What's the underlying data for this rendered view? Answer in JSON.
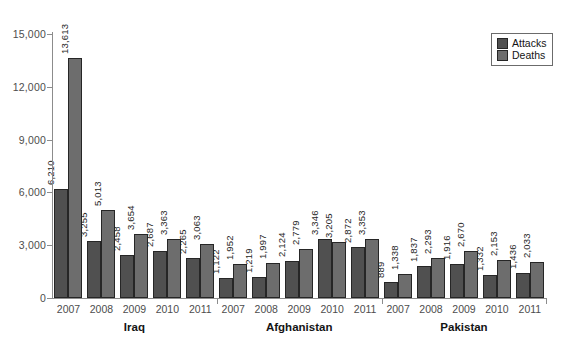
{
  "colors": {
    "attacks": "#505050",
    "deaths": "#6d6d6d",
    "bar_outline": "#262626",
    "axis": "#8c8c8c",
    "background": "#ffffff"
  },
  "chart_data": {
    "type": "bar",
    "title": "",
    "xlabel": "",
    "ylabel": "",
    "ylim": [
      0,
      15000
    ],
    "grid": false,
    "yticks": [
      0,
      3000,
      6000,
      9000,
      12000,
      15000
    ],
    "ytick_labels": [
      "0",
      "3,000",
      "6,000",
      "9,000",
      "12,000",
      "15,000"
    ],
    "legend": {
      "position": "top-right",
      "entries": [
        {
          "label": "Attacks",
          "color": "#505050"
        },
        {
          "label": "Deaths",
          "color": "#6d6d6d"
        }
      ]
    },
    "groups": [
      {
        "label": "Iraq",
        "years": [
          "2007",
          "2008",
          "2009",
          "2010",
          "2011"
        ],
        "series": [
          {
            "name": "Attacks",
            "values": [
              6210,
              3255,
              2458,
              2687,
              2265
            ],
            "labels": [
              "6,210",
              "3,255",
              "2,458",
              "2,687",
              "2,265"
            ]
          },
          {
            "name": "Deaths",
            "values": [
              13613,
              5013,
              3654,
              3363,
              3063
            ],
            "labels": [
              "13,613",
              "5,013",
              "3,654",
              "3,363",
              "3,063"
            ]
          }
        ]
      },
      {
        "label": "Afghanistan",
        "years": [
          "2007",
          "2008",
          "2009",
          "2010",
          "2011"
        ],
        "series": [
          {
            "name": "Attacks",
            "values": [
              1122,
              1219,
              2124,
              3346,
              2872
            ],
            "labels": [
              "1,122",
              "1,219",
              "2,124",
              "3,346",
              "2,872"
            ]
          },
          {
            "name": "Deaths",
            "values": [
              1952,
              1997,
              2779,
              3205,
              3353
            ],
            "labels": [
              "1,952",
              "1,997",
              "2,779",
              "3,205",
              "3,353"
            ]
          }
        ]
      },
      {
        "label": "Pakistan",
        "years": [
          "2007",
          "2008",
          "2009",
          "2010",
          "2011"
        ],
        "series": [
          {
            "name": "Attacks",
            "values": [
              889,
              1837,
              1916,
              1332,
              1436
            ],
            "labels": [
              "889",
              "1,837",
              "1,916",
              "1,332",
              "1,436"
            ]
          },
          {
            "name": "Deaths",
            "values": [
              1338,
              2293,
              2670,
              2153,
              2033
            ],
            "labels": [
              "1,338",
              "2,293",
              "2,670",
              "2,153",
              "2,033"
            ]
          }
        ]
      }
    ]
  }
}
